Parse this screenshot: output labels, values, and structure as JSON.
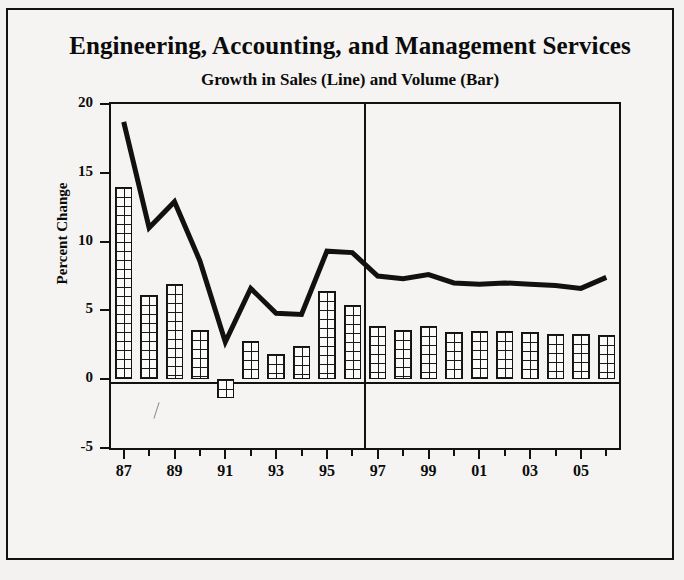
{
  "chart_data": {
    "type": "bar",
    "title": "Engineering, Accounting, and Management Services",
    "subtitle": "Growth in Sales (Line) and Volume (Bar)",
    "xlabel": "",
    "ylabel": "Percent Change",
    "ylim": [
      -5,
      20
    ],
    "ytick_labels": [
      "20",
      "15",
      "10",
      "5",
      "0",
      "-5"
    ],
    "ytick_values": [
      20,
      15,
      10,
      5,
      0,
      -5
    ],
    "grid": false,
    "legend": "inline-in-subtitle",
    "x": [
      1987,
      1988,
      1989,
      1990,
      1991,
      1992,
      1993,
      1994,
      1995,
      1996,
      1997,
      1998,
      1999,
      2000,
      2001,
      2002,
      2003,
      2004,
      2005,
      2006
    ],
    "xtick_labels": [
      "87",
      "",
      "89",
      "",
      "91",
      "",
      "93",
      "",
      "95",
      "",
      "97",
      "",
      "99",
      "",
      "01",
      "",
      "03",
      "",
      "05",
      ""
    ],
    "divider_note": "vertical line between 1996 and 1997 separating history from forecast",
    "divider_after_year": 1996,
    "series": [
      {
        "name": "Growth in Sales (Line)",
        "style": "line",
        "values": [
          18.7,
          11.0,
          12.9,
          8.6,
          2.7,
          6.6,
          4.8,
          4.7,
          9.3,
          9.2,
          7.5,
          7.3,
          7.6,
          7.0,
          6.9,
          7.0,
          6.9,
          6.8,
          6.6,
          7.4
        ]
      },
      {
        "name": "Growth in Volume (Bar)",
        "style": "bar",
        "values": [
          14.0,
          6.1,
          6.9,
          3.6,
          -1.4,
          2.8,
          1.8,
          2.4,
          6.4,
          5.4,
          3.9,
          3.6,
          3.9,
          3.4,
          3.5,
          3.5,
          3.4,
          3.3,
          3.3,
          3.2
        ]
      }
    ]
  },
  "colors": {
    "ink": "#111111",
    "paper": "#f5f4f2",
    "page": "#f2f1ef"
  }
}
